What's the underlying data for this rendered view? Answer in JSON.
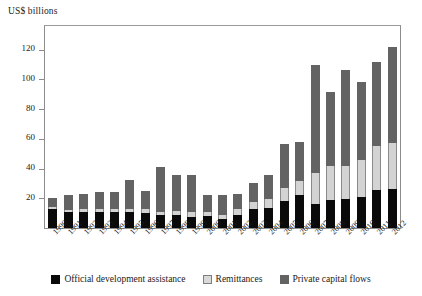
{
  "chart_data": {
    "type": "bar",
    "subtype": "stacked-vertical",
    "title": "",
    "ylabel": "US$ billions",
    "xlabel": "",
    "ylim": [
      0,
      136
    ],
    "yticks": [
      20,
      40,
      60,
      80,
      100,
      120
    ],
    "grid": false,
    "legend_position": "bottom",
    "categories": [
      "1990",
      "1991",
      "1992",
      "1993",
      "1994",
      "1995",
      "1996",
      "1997",
      "1998",
      "1999",
      "2000",
      "2001",
      "2002",
      "2003",
      "2004",
      "2005",
      "2006",
      "2007",
      "2008",
      "2009",
      "2010",
      "2011",
      "2012"
    ],
    "series": [
      {
        "name": "Official development assistance",
        "color": "#0a0a0a",
        "values": [
          12.5,
          10.5,
          10.5,
          10.5,
          10.5,
          10.5,
          10.0,
          8.5,
          8.5,
          7.5,
          8.0,
          6.0,
          9.0,
          13.0,
          13.5,
          18.5,
          22.0,
          16.0,
          19.0,
          19.5,
          21.0,
          25.5,
          26.5
        ]
      },
      {
        "name": "Remittances",
        "color": "#d3d3d3",
        "values": [
          1.5,
          1.5,
          2.0,
          2.0,
          2.5,
          2.5,
          2.5,
          2.5,
          3.0,
          3.0,
          3.0,
          3.0,
          3.5,
          4.5,
          6.0,
          8.5,
          9.5,
          21.0,
          23.0,
          22.5,
          25.0,
          30.0,
          30.5
        ]
      },
      {
        "name": "Private capital flows",
        "color": "#636363",
        "values": [
          6.0,
          10.0,
          10.5,
          11.5,
          11.5,
          19.5,
          12.5,
          30.0,
          24.5,
          25.5,
          11.0,
          13.0,
          10.5,
          12.5,
          16.5,
          29.5,
          26.5,
          73.0,
          49.5,
          64.5,
          52.5,
          56.5,
          65.0
        ]
      }
    ],
    "totals": [
      20,
      22,
      23,
      24,
      24.5,
      32.5,
      25,
      41,
      36,
      36,
      22,
      22,
      23,
      30,
      36,
      56.5,
      58,
      110,
      91.5,
      106.5,
      98.5,
      112,
      122
    ]
  },
  "legend": {
    "items": [
      {
        "label": "Official development assistance",
        "swatch": "oda"
      },
      {
        "label": "Remittances",
        "swatch": "rem"
      },
      {
        "label": "Private capital flows",
        "swatch": "pcf"
      }
    ]
  }
}
